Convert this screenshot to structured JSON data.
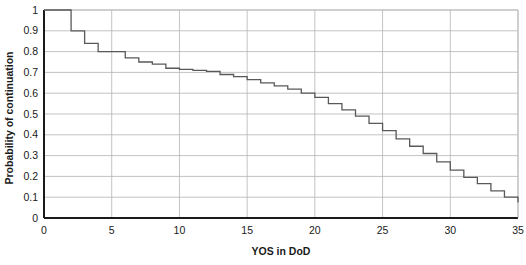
{
  "figure": {
    "background_color": "#ffffff",
    "plot_border_color": "#1a1a1a",
    "gridline_color": "#b4b4b4",
    "series_color": "#595959"
  },
  "chart_data": {
    "type": "line",
    "subtype": "step",
    "title": "",
    "subtitle": "",
    "xlabel": "YOS in DoD",
    "ylabel": "Probability of continuation",
    "xlim": [
      0,
      35
    ],
    "ylim": [
      0,
      1
    ],
    "xticks": [
      0,
      5,
      10,
      15,
      20,
      25,
      30,
      35
    ],
    "xtick_labels": [
      "0",
      "5",
      "10",
      "15",
      "20",
      "25",
      "30",
      "35"
    ],
    "yticks": [
      0,
      0.1,
      0.2,
      0.3,
      0.4,
      0.5,
      0.6,
      0.7,
      0.8,
      0.9,
      1
    ],
    "ytick_labels": [
      "0",
      "0.1",
      "0.2",
      "0.3",
      "0.4",
      "0.5",
      "0.6",
      "0.7",
      "0.8",
      "0.9",
      "1"
    ],
    "grid": {
      "horizontal": true,
      "vertical": true
    },
    "legend": {
      "visible": false,
      "position": "none",
      "entries": []
    },
    "annotations": [],
    "series": [
      {
        "name": "Probability of continuation",
        "x": [
          0,
          1,
          2,
          3,
          4,
          5,
          6,
          7,
          8,
          9,
          10,
          11,
          12,
          13,
          14,
          15,
          16,
          17,
          18,
          19,
          20,
          21,
          22,
          23,
          24,
          25,
          26,
          27,
          28,
          29,
          30,
          31,
          32,
          33,
          34,
          35
        ],
        "values": [
          1.0,
          1.0,
          0.9,
          0.84,
          0.8,
          0.8,
          0.77,
          0.75,
          0.74,
          0.72,
          0.715,
          0.71,
          0.705,
          0.69,
          0.68,
          0.665,
          0.65,
          0.635,
          0.62,
          0.6,
          0.58,
          0.55,
          0.52,
          0.49,
          0.455,
          0.42,
          0.38,
          0.345,
          0.31,
          0.27,
          0.23,
          0.195,
          0.165,
          0.13,
          0.1,
          0.075
        ]
      }
    ]
  }
}
